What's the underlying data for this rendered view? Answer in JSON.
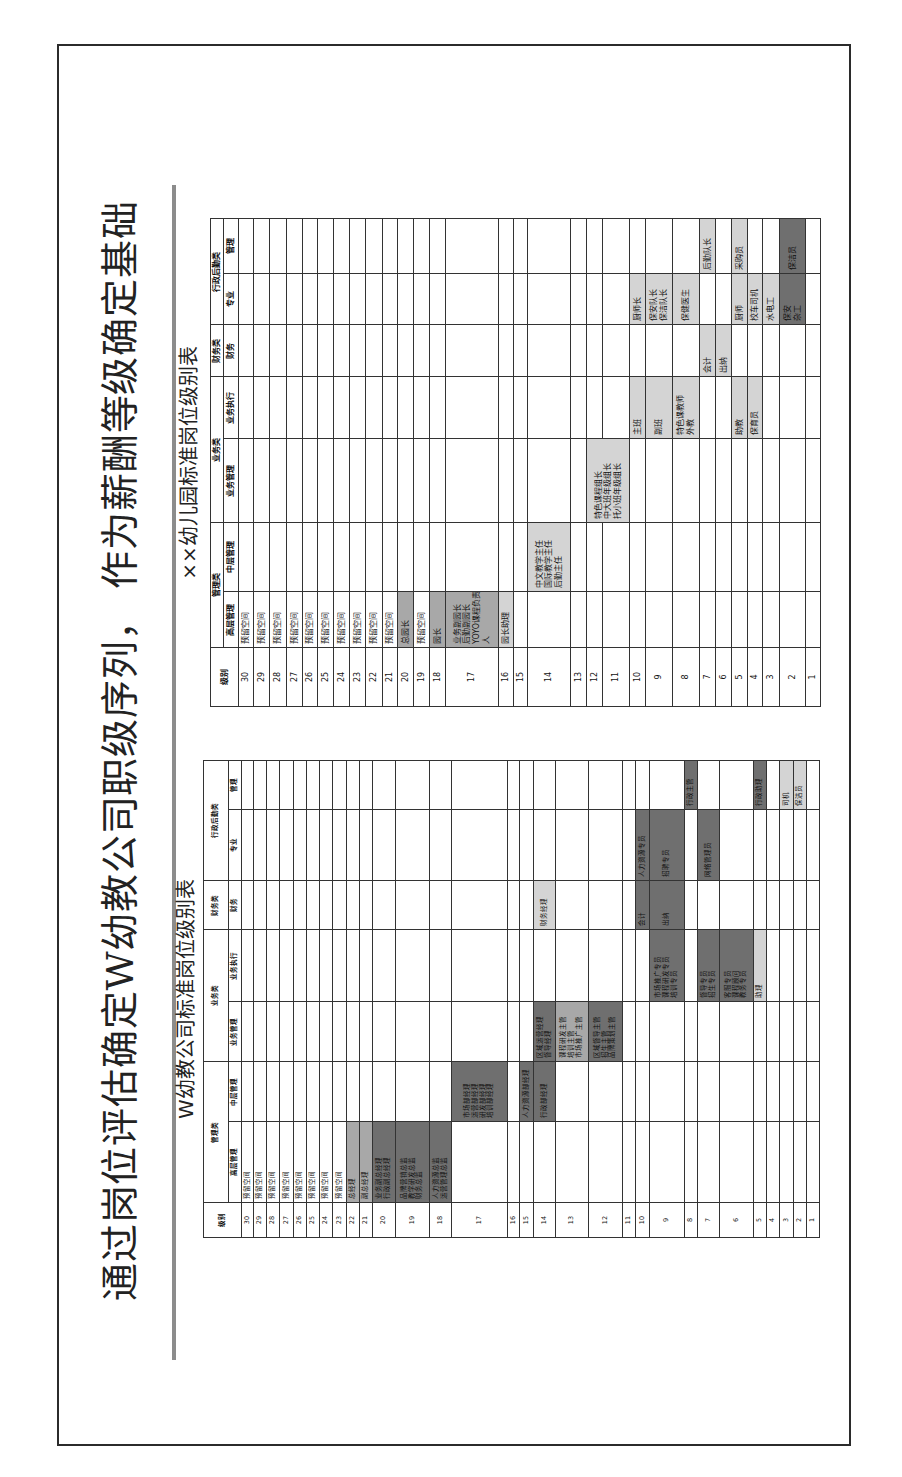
{
  "slide": {
    "title": "通过岗位评估确定W幼教公司职级序列， 作为薪酬等级确定基础"
  },
  "colors": {
    "light": "#d4d4d4",
    "medium": "#a8a8a8",
    "dark": "#6f6f6f"
  },
  "tables": [
    {
      "id": "company",
      "title": "W幼教公司标准岗位级别表",
      "level_header": "级别",
      "categories": [
        {
          "label": "管理类",
          "columns": [
            "高层管理",
            "中层管理"
          ]
        },
        {
          "label": "业务类",
          "columns": [
            "业务管理",
            "业务执行"
          ]
        },
        {
          "label": "财务类",
          "columns": [
            "财务"
          ]
        },
        {
          "label": "行政后勤类",
          "columns": [
            "专业",
            "管理"
          ]
        }
      ],
      "levels": [
        30,
        29,
        28,
        27,
        26,
        25,
        24,
        23,
        22,
        21,
        20,
        19,
        18,
        17,
        16,
        15,
        14,
        13,
        12,
        11,
        10,
        9,
        8,
        7,
        6,
        5,
        4,
        3,
        2,
        1
      ],
      "positions": [
        {
          "levels": [
            30
          ],
          "column": "高层管理",
          "lines": [
            "预留空间"
          ],
          "shade": "none"
        },
        {
          "levels": [
            29
          ],
          "column": "高层管理",
          "lines": [
            "预留空间"
          ],
          "shade": "none"
        },
        {
          "levels": [
            28
          ],
          "column": "高层管理",
          "lines": [
            "预留空间"
          ],
          "shade": "none"
        },
        {
          "levels": [
            27
          ],
          "column": "高层管理",
          "lines": [
            "预留空间"
          ],
          "shade": "none"
        },
        {
          "levels": [
            26
          ],
          "column": "高层管理",
          "lines": [
            "预留空间"
          ],
          "shade": "none"
        },
        {
          "levels": [
            25
          ],
          "column": "高层管理",
          "lines": [
            "预留空间"
          ],
          "shade": "none"
        },
        {
          "levels": [
            24
          ],
          "column": "高层管理",
          "lines": [
            "预留空间"
          ],
          "shade": "none"
        },
        {
          "levels": [
            23
          ],
          "column": "高层管理",
          "lines": [
            "预留空间"
          ],
          "shade": "none"
        },
        {
          "levels": [
            22
          ],
          "column": "高层管理",
          "lines": [
            "总经理"
          ],
          "shade": "medium"
        },
        {
          "levels": [
            21
          ],
          "column": "高层管理",
          "lines": [
            "副总经理"
          ],
          "shade": "medium"
        },
        {
          "levels": [
            20
          ],
          "column": "高层管理",
          "lines": [
            "业务副总经理",
            "行政副总经理"
          ],
          "shade": "dark"
        },
        {
          "levels": [
            19
          ],
          "column": "高层管理",
          "lines": [
            "品牌营销总监",
            "教学研发总监",
            "财务总监"
          ],
          "shade": "dark"
        },
        {
          "levels": [
            18
          ],
          "column": "高层管理",
          "lines": [
            "人力资源总监",
            "运营管理总监"
          ],
          "shade": "dark"
        },
        {
          "levels": [
            17
          ],
          "column": "中层管理",
          "lines": [
            "市场部经理",
            "运营部经理",
            "研发部经理",
            "培训部经理"
          ],
          "shade": "dark"
        },
        {
          "levels": [
            15
          ],
          "column": "中层管理",
          "lines": [
            "人力资源部经理"
          ],
          "shade": "dark"
        },
        {
          "levels": [
            14
          ],
          "column": "中层管理",
          "lines": [
            "行政部经理"
          ],
          "shade": "dark"
        },
        {
          "levels": [
            14
          ],
          "column": "业务管理",
          "lines": [
            "区域运营经理",
            "督导经理"
          ],
          "shade": "dark"
        },
        {
          "levels": [
            14
          ],
          "column": "财务",
          "lines": [
            "财务经理"
          ],
          "shade": "light"
        },
        {
          "levels": [
            13
          ],
          "column": "业务管理",
          "lines": [
            "课程研发主管",
            "培训主管",
            "市场推广主管"
          ],
          "shade": "medium"
        },
        {
          "levels": [
            12
          ],
          "column": "业务管理",
          "lines": [
            "区域督导主管",
            "招生主管",
            "品牌策划主管"
          ],
          "shade": "dark"
        },
        {
          "levels": [
            10
          ],
          "column": "财务",
          "lines": [
            "会计"
          ],
          "shade": "dark"
        },
        {
          "levels": [
            10
          ],
          "column": "专业",
          "lines": [
            "人力资源专员"
          ],
          "shade": "dark"
        },
        {
          "levels": [
            9
          ],
          "column": "业务执行",
          "lines": [
            "市场推广专员",
            "课程研发专员",
            "培训专员"
          ],
          "shade": "dark"
        },
        {
          "levels": [
            9
          ],
          "column": "财务",
          "lines": [
            "出纳"
          ],
          "shade": "dark"
        },
        {
          "levels": [
            9
          ],
          "column": "专业",
          "lines": [
            "招聘专员"
          ],
          "shade": "dark"
        },
        {
          "levels": [
            8
          ],
          "column": "管理",
          "lines": [
            "行政主管"
          ],
          "shade": "dark"
        },
        {
          "levels": [
            7
          ],
          "column": "业务执行",
          "lines": [
            "督导专员",
            "招生专员"
          ],
          "shade": "dark"
        },
        {
          "levels": [
            7
          ],
          "column": "专业",
          "lines": [
            "网络管理员"
          ],
          "shade": "dark"
        },
        {
          "levels": [
            6
          ],
          "column": "业务执行",
          "lines": [
            "客服专员",
            "课程顾问",
            "教务专员"
          ],
          "shade": "dark"
        },
        {
          "levels": [
            5
          ],
          "column": "业务执行",
          "lines": [
            "助理"
          ],
          "shade": "light"
        },
        {
          "levels": [
            5
          ],
          "column": "管理",
          "lines": [
            "行政助理"
          ],
          "shade": "dark"
        },
        {
          "levels": [
            3
          ],
          "column": "管理",
          "lines": [
            "司机"
          ],
          "shade": "light"
        },
        {
          "levels": [
            2
          ],
          "column": "管理",
          "lines": [
            "保洁员"
          ],
          "shade": "light"
        }
      ]
    },
    {
      "id": "kindergarten",
      "title": "××幼儿园标准岗位级别表",
      "level_header": "级别",
      "categories": [
        {
          "label": "管理类",
          "columns": [
            "高层管理",
            "中层管理"
          ]
        },
        {
          "label": "业务类",
          "columns": [
            "业务管理",
            "业务执行"
          ]
        },
        {
          "label": "财务类",
          "columns": [
            "财务"
          ]
        },
        {
          "label": "行政后勤类",
          "columns": [
            "专业",
            "管理"
          ]
        }
      ],
      "levels": [
        30,
        29,
        28,
        27,
        26,
        25,
        24,
        23,
        22,
        21,
        20,
        19,
        18,
        17,
        16,
        15,
        14,
        13,
        12,
        11,
        10,
        9,
        8,
        7,
        6,
        5,
        4,
        3,
        2,
        1
      ],
      "positions": [
        {
          "levels": [
            30
          ],
          "column": "高层管理",
          "lines": [
            "预留空间"
          ],
          "shade": "none"
        },
        {
          "levels": [
            29
          ],
          "column": "高层管理",
          "lines": [
            "预留空间"
          ],
          "shade": "none"
        },
        {
          "levels": [
            28
          ],
          "column": "高层管理",
          "lines": [
            "预留空间"
          ],
          "shade": "none"
        },
        {
          "levels": [
            27
          ],
          "column": "高层管理",
          "lines": [
            "预留空间"
          ],
          "shade": "none"
        },
        {
          "levels": [
            26
          ],
          "column": "高层管理",
          "lines": [
            "预留空间"
          ],
          "shade": "none"
        },
        {
          "levels": [
            25
          ],
          "column": "高层管理",
          "lines": [
            "预留空间"
          ],
          "shade": "none"
        },
        {
          "levels": [
            24
          ],
          "column": "高层管理",
          "lines": [
            "预留空间"
          ],
          "shade": "none"
        },
        {
          "levels": [
            23
          ],
          "column": "高层管理",
          "lines": [
            "预留空间"
          ],
          "shade": "none"
        },
        {
          "levels": [
            22
          ],
          "column": "高层管理",
          "lines": [
            "预留空间"
          ],
          "shade": "none"
        },
        {
          "levels": [
            21
          ],
          "column": "高层管理",
          "lines": [
            "预留空间"
          ],
          "shade": "none"
        },
        {
          "levels": [
            20
          ],
          "column": "高层管理",
          "lines": [
            "总园长"
          ],
          "shade": "medium"
        },
        {
          "levels": [
            19
          ],
          "column": "高层管理",
          "lines": [
            "预留空间"
          ],
          "shade": "none"
        },
        {
          "levels": [
            18
          ],
          "column": "高层管理",
          "lines": [
            "园长"
          ],
          "shade": "medium"
        },
        {
          "levels": [
            17
          ],
          "column": "高层管理",
          "lines": [
            "业务副园长",
            "后勤副园长",
            "YOYO课程负责",
            "人"
          ],
          "shade": "medium"
        },
        {
          "levels": [
            16
          ],
          "column": "高层管理",
          "lines": [
            "园长助理"
          ],
          "shade": "light"
        },
        {
          "levels": [
            14
          ],
          "column": "中层管理",
          "lines": [
            "中文教学主任",
            "国际教学主任",
            "后勤主任"
          ],
          "shade": "light"
        },
        {
          "levels": [
            12,
            11
          ],
          "column": "业务管理",
          "lines": [
            "特色课程组长",
            "中大班年级组长",
            "托小班年级组长"
          ],
          "shade": "light"
        },
        {
          "levels": [
            10
          ],
          "column": "业务执行",
          "lines": [
            "主班"
          ],
          "shade": "light"
        },
        {
          "levels": [
            10
          ],
          "column": "专业",
          "lines": [
            "厨师长"
          ],
          "shade": "light"
        },
        {
          "levels": [
            9
          ],
          "column": "业务执行",
          "lines": [
            "副班"
          ],
          "shade": "light"
        },
        {
          "levels": [
            9
          ],
          "column": "专业",
          "lines": [
            "保安队长",
            "保洁队长"
          ],
          "shade": "light"
        },
        {
          "levels": [
            8
          ],
          "column": "业务执行",
          "lines": [
            "特色课教师",
            "外教"
          ],
          "shade": "light"
        },
        {
          "levels": [
            8
          ],
          "column": "专业",
          "lines": [
            "保健医生"
          ],
          "shade": "light"
        },
        {
          "levels": [
            7
          ],
          "column": "财务",
          "lines": [
            "会计"
          ],
          "shade": "light"
        },
        {
          "levels": [
            7
          ],
          "column": "管理",
          "lines": [
            "后勤队长"
          ],
          "shade": "light"
        },
        {
          "levels": [
            6
          ],
          "column": "财务",
          "lines": [
            "出纳"
          ],
          "shade": "light"
        },
        {
          "levels": [
            5
          ],
          "column": "业务执行",
          "lines": [
            "助教"
          ],
          "shade": "light"
        },
        {
          "levels": [
            5
          ],
          "column": "专业",
          "lines": [
            "厨师"
          ],
          "shade": "light"
        },
        {
          "levels": [
            5
          ],
          "column": "管理",
          "lines": [
            "采购员"
          ],
          "shade": "light"
        },
        {
          "levels": [
            4
          ],
          "column": "业务执行",
          "lines": [
            "保育员"
          ],
          "shade": "light"
        },
        {
          "levels": [
            4
          ],
          "column": "专业",
          "lines": [
            "校车司机"
          ],
          "shade": "light"
        },
        {
          "levels": [
            3
          ],
          "column": "专业",
          "lines": [
            "水电工"
          ],
          "shade": "light"
        },
        {
          "levels": [
            2
          ],
          "column": "专业",
          "lines": [
            "保安",
            "杂工"
          ],
          "shade": "dark"
        },
        {
          "levels": [
            2
          ],
          "column": "管理",
          "lines": [
            "保洁员"
          ],
          "shade": "dark"
        }
      ]
    }
  ]
}
